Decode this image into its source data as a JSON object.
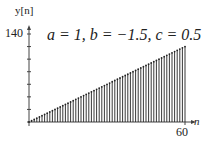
{
  "chart_data": {
    "type": "stem",
    "title": "a = 1, b = −1.5, c = 0.5",
    "xlabel": "n",
    "ylabel": "y[n]",
    "x_tick_labels": [
      "60"
    ],
    "y_tick_labels": [
      "140"
    ],
    "xlim": [
      0,
      60
    ],
    "ylim": [
      0,
      140
    ],
    "y_tick_step": 20,
    "grid": false,
    "legend": null,
    "series": [
      {
        "name": "y[n]",
        "x_start": 0,
        "x_end": 60,
        "slope": 2,
        "description": "linear ramp y[n] ≈ 2n for n = 0..60"
      }
    ]
  },
  "labels": {
    "ylabel": "y[n]",
    "ytick_top": "140",
    "title": "a = 1, b = −1.5, c = 0.5",
    "xlabel": "n",
    "xtick_end": "60"
  }
}
